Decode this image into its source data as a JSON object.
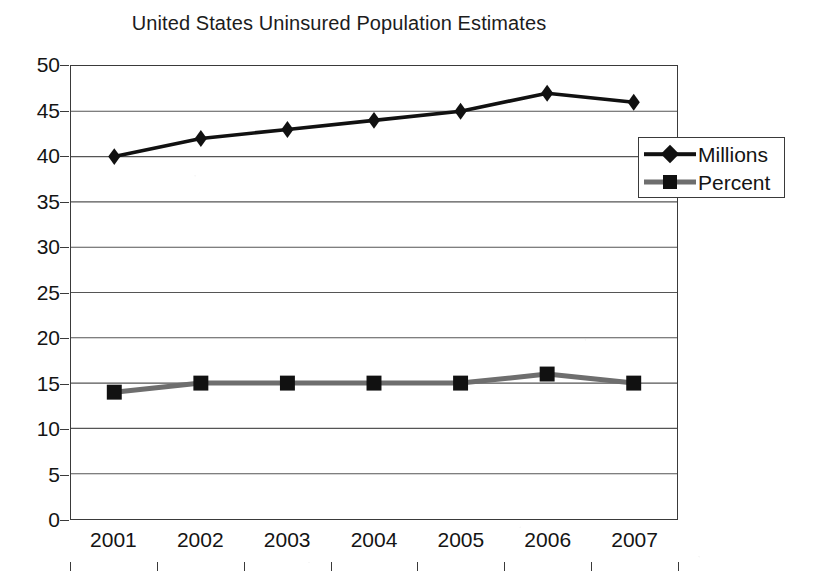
{
  "chart_data": {
    "type": "line",
    "title": "United States Uninsured Population Estimates",
    "xlabel": "",
    "ylabel": "",
    "categories": [
      "2001",
      "2002",
      "2003",
      "2004",
      "2005",
      "2006",
      "2007"
    ],
    "series": [
      {
        "name": "Millions",
        "marker": "diamond",
        "color": "#111111",
        "values": [
          40,
          42,
          43,
          44,
          45,
          47,
          46
        ]
      },
      {
        "name": "Percent",
        "marker": "square",
        "color": "#6e6e6e",
        "values": [
          14,
          15,
          15,
          15,
          15,
          16,
          15
        ]
      }
    ],
    "ylim": [
      0,
      50
    ],
    "ytick_step": 5,
    "yticks": [
      "50",
      "45",
      "40",
      "35",
      "30",
      "25",
      "20",
      "15",
      "10",
      "5",
      "0"
    ],
    "grid": true,
    "grid_axis": "y",
    "legend_position": "upper-right-inside",
    "axis_color": "#3a3a3a",
    "grid_color": "#555555",
    "background": "#ffffff"
  },
  "legend": {
    "entries": [
      {
        "label": "Millions"
      },
      {
        "label": "Percent"
      }
    ]
  }
}
